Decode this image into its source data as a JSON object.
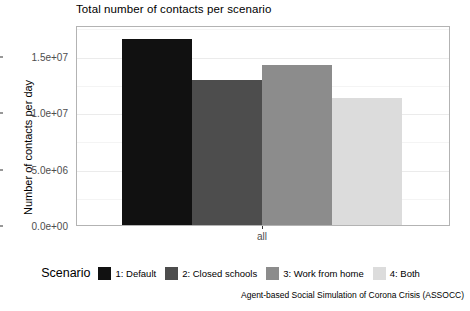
{
  "chart_data": {
    "type": "bar",
    "title": "Total number of contacts per scenario",
    "xlabel": "",
    "ylabel": "Number of contacts per day",
    "categories": [
      "all"
    ],
    "x_tick_labels": [
      "all"
    ],
    "y_tick_labels": [
      "0.0e+00",
      "5.0e+06",
      "1.0e+07",
      "1.5e+07"
    ],
    "y_tick_values": [
      0,
      5000000,
      10000000,
      15000000
    ],
    "ylim": [
      0,
      17700000
    ],
    "grid": true,
    "legend_position": "bottom",
    "legend_title": "Scenario",
    "series": [
      {
        "name": "1: Default",
        "values": [
          16500000
        ],
        "color": "#111111"
      },
      {
        "name": "2: Closed schools",
        "values": [
          12800000
        ],
        "color": "#4d4d4d"
      },
      {
        "name": "3: Work from home",
        "values": [
          14200000
        ],
        "color": "#8c8c8c"
      },
      {
        "name": "4: Both",
        "values": [
          11200000
        ],
        "color": "#dcdcdc"
      }
    ]
  },
  "caption": "Agent-based Social Simulation of Corona Crisis (ASSOCC)",
  "panel": {
    "background": "#ffffff",
    "border_color": "#b3b3b3",
    "gridline_color": "#ebebeb"
  }
}
